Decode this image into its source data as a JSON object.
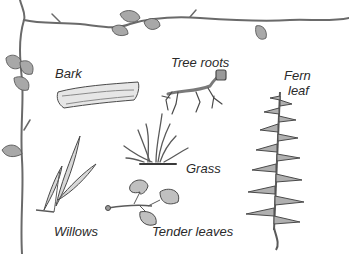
{
  "diagram": {
    "type": "illustrated plant food chart",
    "labels": {
      "bark": "Bark",
      "tree_roots": "Tree roots",
      "fern_leaf_line1": "Fern",
      "fern_leaf_line2": "leaf",
      "grass": "Grass",
      "willows": "Willows",
      "tender_leaves": "Tender leaves"
    },
    "items": [
      {
        "name": "Bark",
        "illustration": "curled piece of bark"
      },
      {
        "name": "Tree roots",
        "illustration": "branching root with cut stump"
      },
      {
        "name": "Fern leaf",
        "illustration": "pinnate fern frond"
      },
      {
        "name": "Grass",
        "illustration": "grass tuft"
      },
      {
        "name": "Willows",
        "illustration": "narrow willow leaves"
      },
      {
        "name": "Tender leaves",
        "illustration": "sprig with heart-shaped leaves"
      }
    ],
    "border": "vine with leaves along top and left edges",
    "colors": {
      "ink": "#3a3a3a",
      "shade": "#9a9a9a",
      "light_shade": "#c8c8c8",
      "background": "#ffffff"
    }
  }
}
